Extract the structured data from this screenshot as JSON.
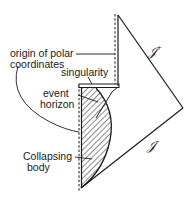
{
  "diagram": {
    "labels": {
      "origin_line1": "origin of polar",
      "origin_line2": "coordinates",
      "singularity": "singularity",
      "event_line1": "event",
      "event_line2": "horizon",
      "collapse_line1": "Collapsing",
      "collapse_line2": "body",
      "scri_plus": "𝒥",
      "scri_plus_sup": "+",
      "scri_minus": "𝒥",
      "scri_minus_sup": "-"
    },
    "colors": {
      "ink": "#1a1a1a",
      "background": "#ffffff"
    }
  }
}
